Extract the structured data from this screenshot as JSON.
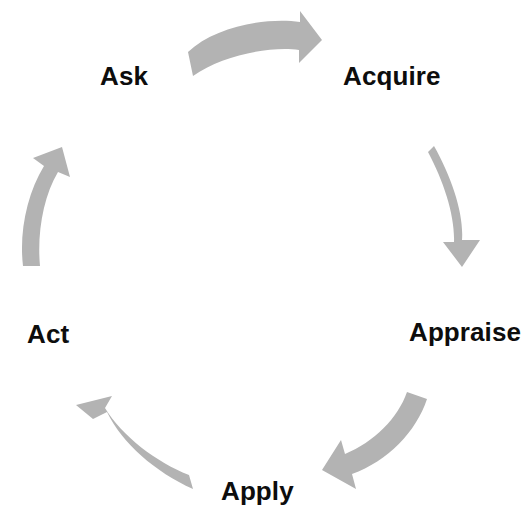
{
  "diagram": {
    "type": "circular-cycle",
    "background_color": "#ffffff",
    "arrow_color": "#b3b3b3",
    "label_color": "#0d0d0d",
    "direction": "clockwise",
    "stages": [
      {
        "id": "ask",
        "label": "Ask",
        "position": "top-left",
        "order": 1
      },
      {
        "id": "acquire",
        "label": "Acquire",
        "position": "top-right",
        "order": 2
      },
      {
        "id": "appraise",
        "label": "Appraise",
        "position": "right",
        "order": 3
      },
      {
        "id": "apply",
        "label": "Apply",
        "position": "bottom",
        "order": 4
      },
      {
        "id": "act",
        "label": "Act",
        "position": "left",
        "order": 5
      }
    ],
    "arrows": [
      {
        "id": "arrow-ask-to-acquire",
        "from": "ask",
        "to": "acquire",
        "position": "top"
      },
      {
        "id": "arrow-acquire-to-appraise",
        "from": "acquire",
        "to": "appraise",
        "position": "right"
      },
      {
        "id": "arrow-appraise-to-apply",
        "from": "appraise",
        "to": "apply",
        "position": "bottom-right"
      },
      {
        "id": "arrow-apply-to-act",
        "from": "apply",
        "to": "act",
        "position": "bottom-left"
      },
      {
        "id": "arrow-act-to-ask",
        "from": "act",
        "to": "ask",
        "position": "left"
      }
    ]
  }
}
